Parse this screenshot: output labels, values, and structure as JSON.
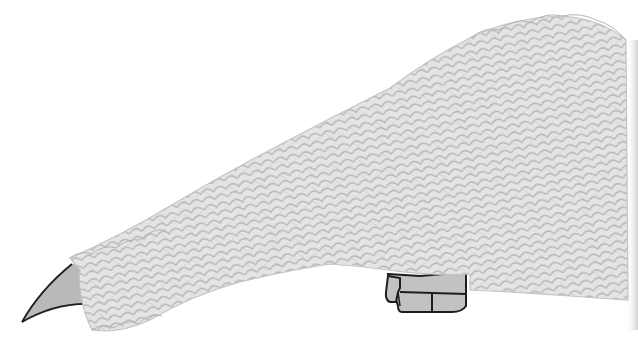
{
  "image": {
    "subject": "feathered creature body with claw and foot",
    "width": 638,
    "height": 348
  },
  "colors": {
    "background": "#ffffff",
    "feather_fill": "#e4e4e4",
    "feather_stroke": "#b4b4b4",
    "claw_fill": "#b9b9b9",
    "foot_fill": "#c2c2c2",
    "outline": "#1e1e1e",
    "right_edge_shadow": "#d2d2d2"
  },
  "parts": [
    {
      "name": "feathered-body",
      "label": ""
    },
    {
      "name": "claw",
      "label": ""
    },
    {
      "name": "foot",
      "label": ""
    }
  ]
}
